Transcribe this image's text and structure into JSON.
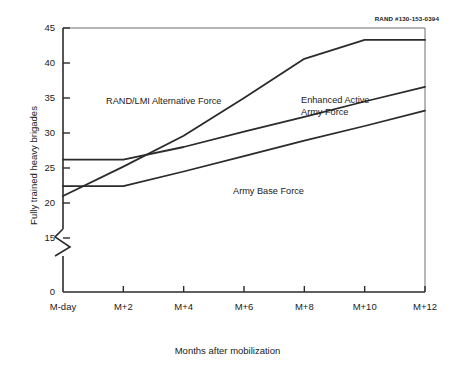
{
  "figure": {
    "rand_id": "RAND #130-153-0394"
  },
  "chart_data": {
    "type": "line",
    "title": "",
    "xlabel": "Months after mobilization",
    "ylabel": "Fully trained heavy brigades",
    "x_tick_labels": [
      "M-day",
      "M+2",
      "M+4",
      "M+6",
      "M+8",
      "M+10",
      "M+12"
    ],
    "x_tick_values": [
      0,
      2,
      4,
      6,
      8,
      10,
      12
    ],
    "xlim": [
      0,
      12
    ],
    "y_tick_labels": [
      "0",
      "15",
      "20",
      "25",
      "30",
      "35",
      "40",
      "45"
    ],
    "y_tick_values": [
      0,
      15,
      20,
      25,
      30,
      35,
      40,
      45
    ],
    "ylim": [
      15,
      45
    ],
    "y_axis_break": true,
    "y_axis_break_between": [
      0,
      15
    ],
    "grid": false,
    "legend_position": "inline-annotations",
    "series": [
      {
        "name": "RAND/LMI Alternative Force",
        "label": "RAND/LMI Alternative Force",
        "x": [
          0,
          2,
          4,
          6,
          8,
          10,
          12
        ],
        "values": [
          21.0,
          25.2,
          29.6,
          35.0,
          40.6,
          43.3,
          43.3
        ]
      },
      {
        "name": "Enhanced Active Army Force",
        "label": "Enhanced Active\nArmy Force",
        "x": [
          0,
          2,
          4,
          6,
          8,
          10,
          12
        ],
        "values": [
          26.2,
          26.2,
          28.0,
          30.2,
          32.3,
          34.5,
          36.6
        ]
      },
      {
        "name": "Army Base Force",
        "label": "Army Base Force",
        "x": [
          0,
          2,
          4,
          6,
          8,
          10,
          12
        ],
        "values": [
          22.4,
          22.4,
          24.5,
          26.7,
          28.9,
          31.0,
          33.2
        ]
      }
    ]
  }
}
